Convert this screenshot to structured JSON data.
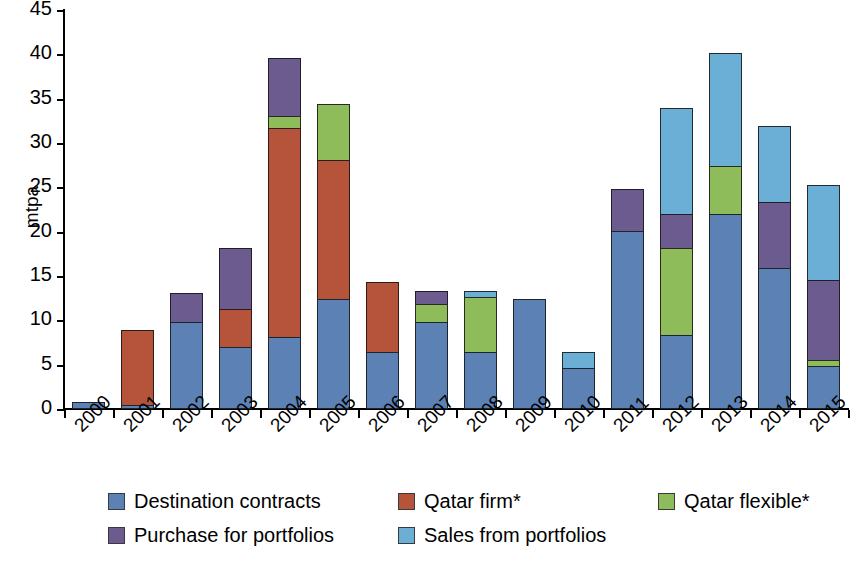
{
  "chart_data": {
    "type": "bar",
    "subtype": "stacked-bar",
    "title": "",
    "xlabel": "",
    "ylabel": "mtpa",
    "ylim": [
      0,
      45
    ],
    "ytick_step": 5,
    "yticks": [
      45,
      40,
      35,
      30,
      25,
      20,
      15,
      10,
      5,
      0
    ],
    "grid": false,
    "legend_position": "bottom",
    "categories": [
      "2000",
      "2001",
      "2002",
      "2003",
      "2004",
      "2005",
      "2006",
      "2007",
      "2008",
      "2009",
      "2010",
      "2011",
      "2012",
      "2013",
      "2014",
      "2015"
    ],
    "series": [
      {
        "name": "Destination contracts",
        "color": "#5B81B5",
        "values": [
          0.8,
          0.4,
          9.8,
          7.0,
          8.1,
          12.4,
          6.4,
          9.8,
          6.4,
          12.4,
          4.6,
          20.1,
          8.3,
          22.0,
          15.9,
          4.8
        ]
      },
      {
        "name": "Qatar firm*",
        "color": "#B5543A",
        "values": [
          0.0,
          8.5,
          0.0,
          4.3,
          23.6,
          15.7,
          7.9,
          0.0,
          0.0,
          0.0,
          0.0,
          0.0,
          0.0,
          0.0,
          0.0,
          0.0
        ]
      },
      {
        "name": "Qatar flexible*",
        "color": "#8FBC5A",
        "values": [
          0.0,
          0.0,
          0.0,
          0.0,
          1.4,
          6.3,
          0.0,
          2.0,
          6.2,
          0.0,
          0.0,
          0.0,
          9.9,
          5.4,
          0.0,
          0.7
        ]
      },
      {
        "name": "Purchase for portfolios",
        "color": "#6B5B8E",
        "values": [
          0.0,
          0.0,
          3.3,
          6.9,
          6.5,
          0.0,
          0.0,
          1.5,
          0.0,
          0.0,
          0.0,
          4.7,
          3.8,
          0.0,
          7.4,
          9.0
        ]
      },
      {
        "name": "Sales from portfolios",
        "color": "#6BAED6",
        "values": [
          0.0,
          0.0,
          0.0,
          0.0,
          0.0,
          0.0,
          0.0,
          0.0,
          0.7,
          0.0,
          1.8,
          0.0,
          12.0,
          12.7,
          8.6,
          10.8
        ]
      }
    ],
    "totals": [
      0.8,
      8.9,
      13.1,
      18.2,
      39.6,
      34.4,
      14.3,
      13.3,
      13.3,
      12.4,
      6.4,
      24.8,
      34.0,
      40.1,
      31.9,
      25.3
    ]
  },
  "legend": {
    "rows": [
      [
        {
          "label": "Destination contracts",
          "color": "#5B81B5"
        },
        {
          "label": "Qatar firm*",
          "color": "#B5543A"
        },
        {
          "label": "Qatar flexible*",
          "color": "#8FBC5A"
        }
      ],
      [
        {
          "label": "Purchase for portfolios",
          "color": "#6B5B8E"
        },
        {
          "label": "Sales from portfolios",
          "color": "#6BAED6"
        }
      ]
    ]
  }
}
